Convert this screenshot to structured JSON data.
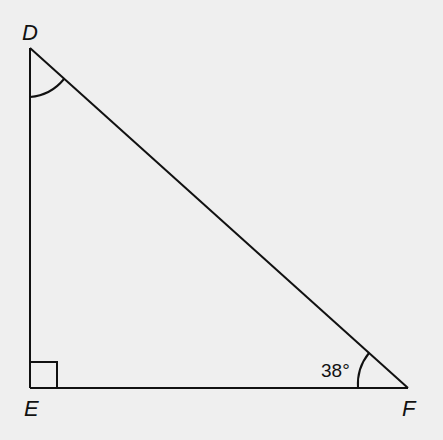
{
  "diagram": {
    "type": "right-triangle",
    "vertices": {
      "D": {
        "label": "D",
        "x": 30,
        "y": 48
      },
      "E": {
        "label": "E",
        "x": 30,
        "y": 388
      },
      "F": {
        "label": "F",
        "x": 408,
        "y": 388
      }
    },
    "right_angle_at": "E",
    "angle_F_label": "38°",
    "angle_D_marked": true,
    "colors": {
      "background": "#efefef",
      "stroke": "#111111"
    }
  }
}
